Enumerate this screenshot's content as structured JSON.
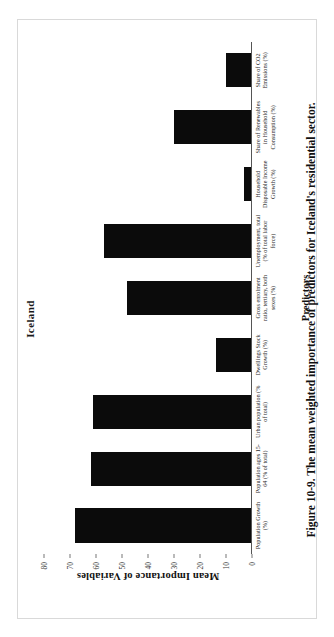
{
  "figure": {
    "caption": "Figure 10-9. The mean weighted importance of predictors for Iceland's residential sector.",
    "title": "Iceland"
  },
  "chart_data": {
    "type": "bar",
    "title": "Iceland",
    "xlabel": "Predictors",
    "ylabel": "Mean Importance of Variables",
    "ylim": [
      0,
      80
    ],
    "yticks": [
      0,
      10,
      20,
      30,
      40,
      50,
      60,
      70,
      80
    ],
    "grid": false,
    "legend": null,
    "orientation": "vertical",
    "bar_color": "#0b0b0b",
    "categories": [
      "Population Growth (%)",
      "Population ages 15-64 (% of total)",
      "Urban population (% of total)",
      "Dwellings Stock Growth (%)",
      "Gross enrolment ratio, tertiary, both sexes (%)",
      "Unemployment, total (% of total labor force)",
      "Household Disposable Income Growth (%)",
      "Share of Renewables in Household Consumption (%)",
      "Share of CO2 Emissions (%)"
    ],
    "values": [
      68,
      62,
      61,
      14,
      48,
      57,
      3,
      30,
      10
    ]
  },
  "axis": {
    "tick_labels": [
      "80",
      "70",
      "60",
      "50",
      "40",
      "30",
      "20",
      "10",
      "0"
    ]
  }
}
